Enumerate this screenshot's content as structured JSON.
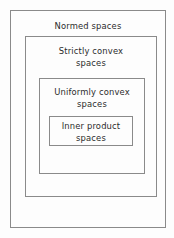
{
  "diagram": {
    "type": "nested-containment-boxes",
    "stroke_color": "#8a8a8a",
    "text_color": "#2b2b2b",
    "background_color": "#fdfdfd",
    "boxes": [
      {
        "id": "normed",
        "label": "Normed spaces",
        "level": 1
      },
      {
        "id": "strictly-convex",
        "label": "Strictly convex\nspaces",
        "level": 2
      },
      {
        "id": "uniformly-convex",
        "label": "Uniformly convex\nspaces",
        "level": 3
      },
      {
        "id": "inner-product",
        "label": "Inner product\nspaces",
        "level": 4
      }
    ]
  }
}
